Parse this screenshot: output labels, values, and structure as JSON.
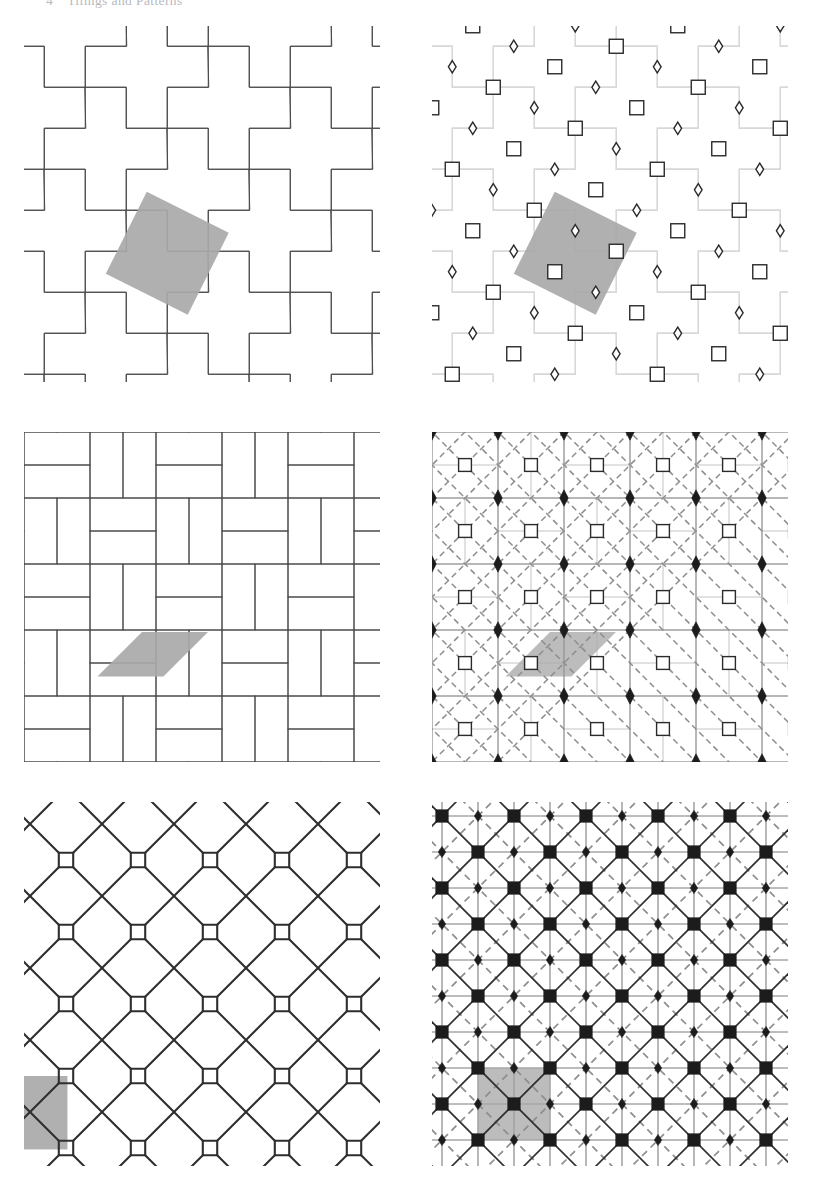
{
  "page": {
    "width": 816,
    "height": 1190,
    "background_color": "#ffffff",
    "running_head": {
      "folio": "4",
      "title": "Tilings and Patterns",
      "color": "#b9b9bd"
    }
  },
  "colors": {
    "ink": "#4a4a4a",
    "ink_dark": "#2f2f2f",
    "ink_light": "#d8d8d8",
    "marker_stroke": "#2b2b2b",
    "marker_fill": "#1c1c1c",
    "cell_highlight": "#a9a9a9",
    "paper": "#ffffff"
  },
  "figure": {
    "name": "tilings-and-symmetry-groups-plate",
    "layout": "3 rows x 2 columns",
    "columns": [
      "tiling",
      "symmetry-diagram"
    ],
    "panels": [
      {
        "id": "panel-top-left",
        "position": "row 1, column 1",
        "kind": "tiling",
        "pattern_name": "pinwheel cross tiling",
        "tile_shape": "Greek cross (pentomino plus)",
        "stroke_color": "#4a4a4a",
        "stroke_width": 1.0,
        "cell_unit": 4,
        "lattice": "square, tilted basis (2,1)",
        "highlight": {
          "shape": "tilted square fundamental domain",
          "fill": "#a9a9a9",
          "center_cell": [
            3.0,
            6.0
          ]
        }
      },
      {
        "id": "panel-top-right",
        "position": "row 1, column 2",
        "kind": "symmetry-diagram",
        "pattern_name": "pinwheel cross tiling symmetry group",
        "underlay": "faint cross tiling",
        "underlay_color": "#d8d8d8",
        "markers": [
          {
            "glyph": "open-square",
            "meaning": "4-fold rotation centre",
            "fill": "#ffffff",
            "stroke": "#2b2b2b"
          },
          {
            "glyph": "open-diamond",
            "meaning": "2-fold rotation centre",
            "fill": "#ffffff",
            "stroke": "#2b2b2b"
          }
        ],
        "mirror_lines": false,
        "glide_lines": false,
        "highlight": {
          "shape": "tilted square fundamental domain",
          "fill": "#a9a9a9",
          "center_cell": [
            3.0,
            6.0
          ]
        }
      },
      {
        "id": "panel-middle-left",
        "position": "row 2, column 1",
        "kind": "tiling",
        "pattern_name": "basketweave / herringbone brick tiling",
        "tile_shape": "1x2 rectangle (domino)",
        "stroke_color": "#4a4a4a",
        "stroke_width": 1.0,
        "highlight": {
          "shape": "parallelogram unit cell",
          "fill": "#a9a9a9"
        }
      },
      {
        "id": "panel-middle-right",
        "position": "row 2, column 2",
        "kind": "symmetry-diagram",
        "pattern_name": "basketweave tiling symmetry group",
        "markers": [
          {
            "glyph": "filled-diamond",
            "meaning": "2-fold rotation centre",
            "fill": "#1c1c1c"
          },
          {
            "glyph": "open-square",
            "meaning": "4-fold rotation centre",
            "fill": "#ffffff",
            "stroke": "#2b2b2b"
          }
        ],
        "mirror_lines": true,
        "mirror_style": "solid",
        "glide_lines": true,
        "glide_style": "dashed diagonal",
        "highlight": {
          "shape": "parallelogram unit cell",
          "fill": "#a9a9a9"
        }
      },
      {
        "id": "panel-bottom-left",
        "position": "row 3, column 1",
        "kind": "tiling",
        "pattern_name": "octagon and four-pointed star pattern",
        "tile_shape": "octagon with crossing line pairs",
        "stroke_color": "#2f2f2f",
        "stroke_width": 2.0,
        "highlight": {
          "shape": "square unit cell",
          "fill": "#a9a9a9",
          "location": "lower-left"
        }
      },
      {
        "id": "panel-bottom-right",
        "position": "row 3, column 2",
        "kind": "symmetry-diagram",
        "pattern_name": "octagon star pattern symmetry group",
        "markers": [
          {
            "glyph": "filled-square",
            "meaning": "4-fold rotation centre",
            "fill": "#1c1c1c"
          },
          {
            "glyph": "filled-diamond",
            "meaning": "2-fold rotation centre",
            "fill": "#1c1c1c"
          }
        ],
        "mirror_lines": true,
        "mirror_style": "solid horizontal, vertical and diagonal",
        "glide_lines": true,
        "glide_style": "dashed diagonal",
        "highlight": {
          "shape": "square unit cell",
          "fill": "#a9a9a9",
          "location": "lower-left"
        }
      }
    ]
  }
}
